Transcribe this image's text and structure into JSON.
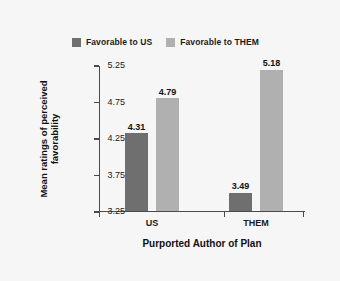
{
  "chart_data": {
    "type": "bar",
    "title": "",
    "xlabel": "Purported Author of Plan",
    "ylabel_line1": "Mean ratings of perceived",
    "ylabel_line2": "favorability",
    "categories": [
      "US",
      "THEM"
    ],
    "series": [
      {
        "name": "Favorable to US",
        "color": "#6f6f6f",
        "values": [
          4.31,
          3.49
        ],
        "labels": [
          "4.31",
          "3.49"
        ]
      },
      {
        "name": "Favorable to THEM",
        "color": "#b0b0b0",
        "values": [
          4.79,
          5.18
        ],
        "labels": [
          "4.79",
          "5.18"
        ]
      }
    ],
    "ylim": [
      3.25,
      5.25
    ],
    "yticks": [
      5.25,
      4.75,
      4.25,
      3.75,
      3.25
    ],
    "ytick_labels": [
      "5.25",
      "4.75",
      "4.25",
      "3.75",
      "3.25"
    ],
    "grid": false,
    "legend_position": "top"
  },
  "legend": {
    "items": [
      {
        "label": "Favorable to US",
        "color": "#6f6f6f"
      },
      {
        "label": "Favorable to THEM",
        "color": "#b0b0b0"
      }
    ]
  },
  "colors": {
    "background": "#f6f6f6",
    "axis": "#4a4a4a",
    "text": "#1b1b1b",
    "series_us": "#6f6f6f",
    "series_them": "#b0b0b0"
  }
}
